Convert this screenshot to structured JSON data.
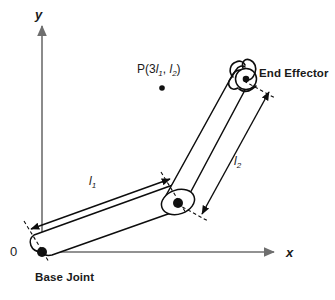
{
  "figure": {
    "axes": {
      "x_label": "x",
      "y_label": "y",
      "origin_label": "0"
    },
    "labels": {
      "link1": "l",
      "link1_sub": "1",
      "link2": "l",
      "link2_sub": "2",
      "base_joint": "Base Joint",
      "end_effector": "End Effector",
      "target_point_prefix": "P(3",
      "target_point_l1": "l",
      "target_point_l1_sub": "1",
      "target_point_sep": ", ",
      "target_point_l2": "l",
      "target_point_l2_sub": "2",
      "target_point_suffix": ")"
    },
    "colors": {
      "axis": "#6e6e6e",
      "arm_outline": "#0d0d0d",
      "joint_fill": "#111111",
      "text": "#1a1a1a",
      "background": "#ffffff"
    },
    "geometry": {
      "origin": [
        42,
        252
      ],
      "elbow": [
        178,
        203
      ],
      "end_effector": [
        247,
        77
      ],
      "target_point": [
        162,
        88
      ],
      "x_axis_end": [
        278,
        252
      ],
      "y_axis_top": [
        42,
        22
      ]
    }
  }
}
